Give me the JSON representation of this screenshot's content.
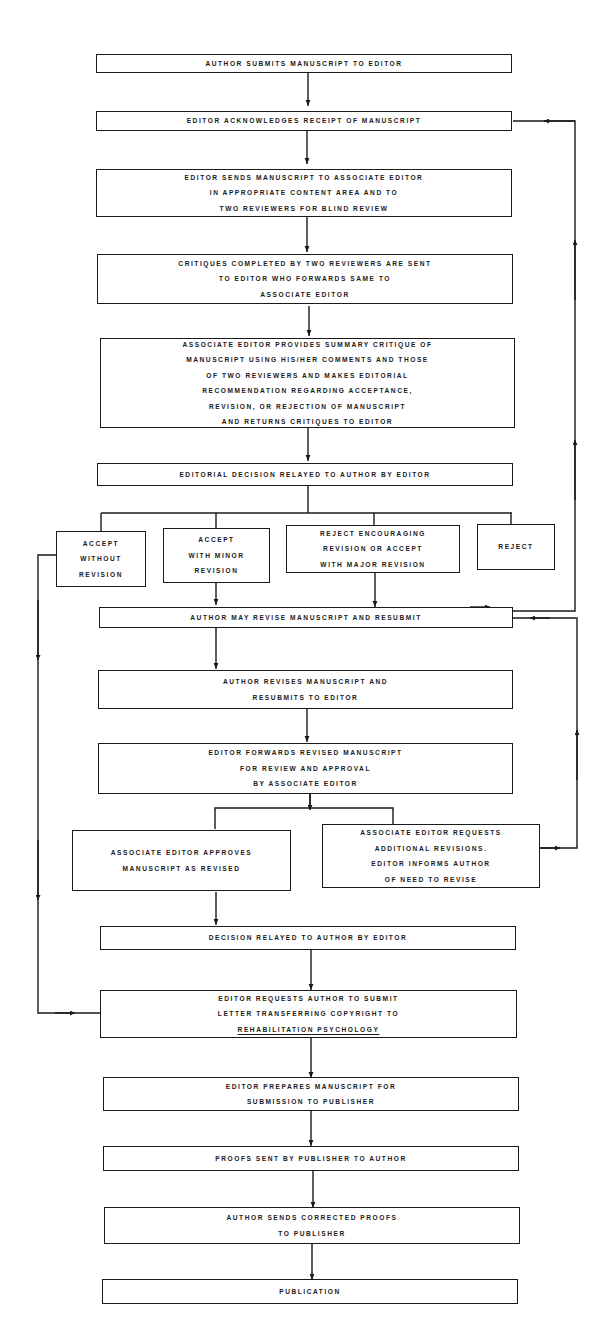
{
  "diagram": {
    "type": "flowchart",
    "title": "",
    "nodes": [
      {
        "id": "n1",
        "lines": [
          "AUTHOR SUBMITS MANUSCRIPT TO EDITOR"
        ]
      },
      {
        "id": "n2",
        "lines": [
          "EDITOR ACKNOWLEDGES RECEIPT OF MANUSCRIPT"
        ]
      },
      {
        "id": "n3",
        "lines": [
          "EDITOR SENDS MANUSCRIPT TO ASSOCIATE EDITOR",
          "IN APPROPRIATE CONTENT AREA AND TO",
          "TWO REVIEWERS FOR BLIND REVIEW"
        ]
      },
      {
        "id": "n4",
        "lines": [
          "CRITIQUES COMPLETED BY TWO REVIEWERS ARE SENT",
          "TO EDITOR WHO FORWARDS SAME TO",
          "ASSOCIATE EDITOR"
        ]
      },
      {
        "id": "n5",
        "lines": [
          "ASSOCIATE EDITOR PROVIDES SUMMARY CRITIQUE OF",
          "MANUSCRIPT USING HIS/HER COMMENTS AND THOSE",
          "OF TWO REVIEWERS AND MAKES EDITORIAL",
          "RECOMMENDATION REGARDING ACCEPTANCE,",
          "REVISION, OR REJECTION OF MANUSCRIPT",
          "AND RETURNS CRITIQUES TO EDITOR"
        ]
      },
      {
        "id": "n6",
        "lines": [
          "EDITORIAL DECISION RELAYED TO AUTHOR BY EDITOR"
        ]
      },
      {
        "id": "n7a",
        "lines": [
          "ACCEPT",
          "WITHOUT",
          "REVISION"
        ]
      },
      {
        "id": "n7b",
        "lines": [
          "ACCEPT",
          "WITH MINOR",
          "REVISION"
        ]
      },
      {
        "id": "n7c",
        "lines": [
          "REJECT ENCOURAGING",
          "REVISION OR ACCEPT",
          "WITH MAJOR REVISION"
        ]
      },
      {
        "id": "n7d",
        "lines": [
          "REJECT"
        ]
      },
      {
        "id": "n8",
        "lines": [
          "AUTHOR MAY REVISE MANUSCRIPT AND RESUBMIT"
        ]
      },
      {
        "id": "n9",
        "lines": [
          "AUTHOR REVISES MANUSCRIPT AND",
          "RESUBMITS TO EDITOR"
        ]
      },
      {
        "id": "n10",
        "lines": [
          "EDITOR FORWARDS REVISED MANUSCRIPT",
          "FOR REVIEW AND APPROVAL",
          "BY ASSOCIATE EDITOR"
        ]
      },
      {
        "id": "n11a",
        "lines": [
          "ASSOCIATE EDITOR APPROVES",
          "MANUSCRIPT AS REVISED"
        ]
      },
      {
        "id": "n11b",
        "lines": [
          "ASSOCIATE EDITOR REQUESTS",
          "ADDITIONAL REVISIONS.",
          "EDITOR INFORMS AUTHOR",
          "OF NEED TO REVISE"
        ]
      },
      {
        "id": "n12",
        "lines": [
          "DECISION RELAYED TO AUTHOR BY EDITOR"
        ]
      },
      {
        "id": "n13",
        "lines": [
          "EDITOR REQUESTS AUTHOR TO SUBMIT",
          "LETTER TRANSFERRING COPYRIGHT TO",
          "REHABILITATION PSYCHOLOGY"
        ],
        "underlined_line_index": 2
      },
      {
        "id": "n14",
        "lines": [
          "EDITOR PREPARES MANUSCRIPT FOR",
          "SUBMISSION TO PUBLISHER"
        ]
      },
      {
        "id": "n15",
        "lines": [
          "PROOFS SENT BY PUBLISHER TO AUTHOR"
        ]
      },
      {
        "id": "n16",
        "lines": [
          "AUTHOR SENDS CORRECTED PROOFS",
          "TO PUBLISHER"
        ]
      },
      {
        "id": "n17",
        "lines": [
          "PUBLICATION"
        ]
      }
    ],
    "edges": [
      {
        "from": "n1",
        "to": "n2"
      },
      {
        "from": "n2",
        "to": "n3"
      },
      {
        "from": "n3",
        "to": "n4"
      },
      {
        "from": "n4",
        "to": "n5"
      },
      {
        "from": "n5",
        "to": "n6"
      },
      {
        "from": "n6",
        "to": [
          "n7a",
          "n7b",
          "n7c",
          "n7d"
        ]
      },
      {
        "from": "n7a",
        "to": "n13"
      },
      {
        "from": "n7b",
        "to": "n8"
      },
      {
        "from": "n7c",
        "to": "n8"
      },
      {
        "from": "n8",
        "to": "n2",
        "route": "right feedback loop"
      },
      {
        "from": "n8",
        "to": "n9"
      },
      {
        "from": "n9",
        "to": "n10"
      },
      {
        "from": "n10",
        "to": [
          "n11a",
          "n11b"
        ]
      },
      {
        "from": "n11b",
        "to": "n8",
        "route": "right feedback loop"
      },
      {
        "from": "n11a",
        "to": "n12"
      },
      {
        "from": "n12",
        "to": "n13"
      },
      {
        "from": "n13",
        "to": "n14"
      },
      {
        "from": "n14",
        "to": "n15"
      },
      {
        "from": "n15",
        "to": "n16"
      },
      {
        "from": "n16",
        "to": "n17"
      }
    ],
    "colors": {
      "ink": "#1a1a1a",
      "background": "#ffffff"
    }
  }
}
